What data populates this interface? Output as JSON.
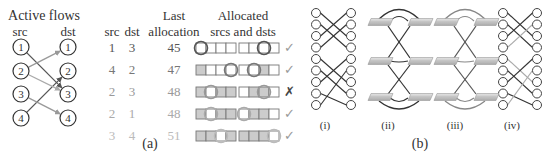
{
  "panel_a": {
    "label": "(a)",
    "active_flows": {
      "title": "Active flows",
      "src_header": "src",
      "dst_header": "dst",
      "src_nodes": [
        "1",
        "2",
        "3",
        "4"
      ],
      "dst_nodes": [
        "1",
        "2",
        "3",
        "4"
      ],
      "flows": [
        {
          "from": 1,
          "to": 3,
          "color": "#555555"
        },
        {
          "from": 2,
          "to": 1,
          "color": "#999999"
        },
        {
          "from": 4,
          "to": 2,
          "color": "#555555"
        },
        {
          "from": 2,
          "to": 3,
          "color": "#aaaaaa"
        },
        {
          "from": 3,
          "to": 4,
          "color": "#999999"
        }
      ]
    },
    "table": {
      "headers": {
        "src": "src",
        "dst": "dst",
        "last_line1": "Last",
        "last_line2": "allocation",
        "alloc_line1": "Allocated",
        "alloc_line2": "srcs and dsts"
      },
      "rows": [
        {
          "src": "1",
          "dst": "3",
          "last": "45",
          "color": "#555555",
          "srcs": [
            0,
            0,
            0,
            0
          ],
          "src_circle": 0,
          "dsts": [
            0,
            0,
            0,
            0
          ],
          "dst_circle": 2,
          "result": "✓"
        },
        {
          "src": "4",
          "dst": "2",
          "last": "47",
          "color": "#777777",
          "srcs": [
            1,
            0,
            0,
            0
          ],
          "src_circle": 3,
          "dsts": [
            0,
            0,
            1,
            0
          ],
          "dst_circle": 1,
          "result": "✓"
        },
        {
          "src": "2",
          "dst": "3",
          "last": "48",
          "color": "#999999",
          "srcs": [
            1,
            0,
            1,
            1
          ],
          "src_circle": 1,
          "dsts": [
            0,
            1,
            1,
            0
          ],
          "dst_circle": 2,
          "result": "✗"
        },
        {
          "src": "2",
          "dst": "1",
          "last": "48",
          "color": "#aaaaaa",
          "srcs": [
            1,
            0,
            1,
            1
          ],
          "src_circle": 1,
          "dsts": [
            0,
            1,
            1,
            0
          ],
          "dst_circle": 0,
          "result": "✓"
        },
        {
          "src": "3",
          "dst": "4",
          "last": "51",
          "color": "#bbbbbb",
          "srcs": [
            1,
            1,
            0,
            1
          ],
          "src_circle": 2,
          "dsts": [
            1,
            1,
            1,
            0
          ],
          "dst_circle": 3,
          "result": "✓"
        }
      ]
    }
  },
  "panel_b": {
    "label": "(b)",
    "sub_labels": [
      "(i)",
      "(ii)",
      "(iii)",
      "(iv)"
    ]
  },
  "colors": {
    "ink": "#333333",
    "box_fill": "#cccccc",
    "box_stroke": "#777777"
  }
}
